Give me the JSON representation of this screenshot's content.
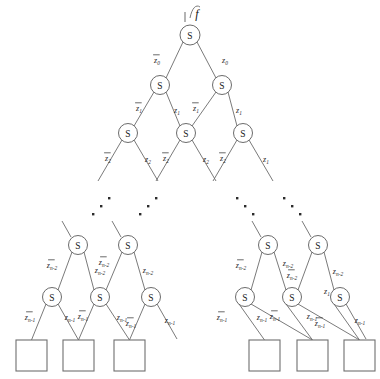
{
  "figure": {
    "type": "binary-decision-tree",
    "function_label": "f",
    "node_symbol": "S",
    "terminal_shape": "square"
  },
  "nodes": {
    "root": {
      "label": "S",
      "x": 190,
      "y": 35,
      "r": 10
    },
    "level2": [
      {
        "label": "S",
        "x": 160,
        "y": 85,
        "r": 9.5
      },
      {
        "label": "S",
        "x": 222,
        "y": 85,
        "r": 9.5
      }
    ],
    "level3": [
      {
        "label": "S",
        "x": 128,
        "y": 133,
        "r": 9.5
      },
      {
        "label": "S",
        "x": 186,
        "y": 133,
        "r": 9.5
      },
      {
        "label": "S",
        "x": 243,
        "y": 133,
        "r": 9.5
      }
    ],
    "left_cluster_upper": [
      {
        "label": "S",
        "x": 78,
        "y": 245,
        "r": 9.5
      },
      {
        "label": "S",
        "x": 128,
        "y": 245,
        "r": 9.5
      }
    ],
    "left_cluster_lower": [
      {
        "label": "S",
        "x": 52,
        "y": 297,
        "r": 9.5
      },
      {
        "label": "S",
        "x": 100,
        "y": 297,
        "r": 9.5
      },
      {
        "label": "S",
        "x": 151,
        "y": 297,
        "r": 9.5
      }
    ],
    "right_cluster_upper": [
      {
        "label": "S",
        "x": 268,
        "y": 245,
        "r": 9.5
      },
      {
        "label": "S",
        "x": 318,
        "y": 245,
        "r": 9.5
      }
    ],
    "right_cluster_lower": [
      {
        "label": "S",
        "x": 245,
        "y": 297,
        "r": 9.5
      },
      {
        "label": "S",
        "x": 292,
        "y": 297,
        "r": 9.5
      },
      {
        "label": "S",
        "x": 340,
        "y": 297,
        "r": 9.5
      }
    ]
  },
  "terminals": [
    {
      "x": 16,
      "y": 340,
      "w": 31,
      "h": 31
    },
    {
      "x": 63,
      "y": 340,
      "w": 31,
      "h": 31
    },
    {
      "x": 114,
      "y": 340,
      "w": 31,
      "h": 31
    },
    {
      "x": 249,
      "y": 340,
      "w": 31,
      "h": 31
    },
    {
      "x": 297,
      "y": 340,
      "w": 31,
      "h": 31
    },
    {
      "x": 344,
      "y": 340,
      "w": 31,
      "h": 31
    }
  ],
  "edge_labels": {
    "level1": [
      {
        "base": "z",
        "sub": "0",
        "negated": true,
        "x": 157,
        "y": 60
      },
      {
        "base": "z",
        "sub": "0",
        "negated": false,
        "x": 225,
        "y": 60
      }
    ],
    "level2": [
      {
        "base": "z",
        "sub": "1",
        "negated": true,
        "x": 139,
        "y": 108
      },
      {
        "base": "z",
        "sub": "1",
        "negated": false,
        "x": 177,
        "y": 110
      },
      {
        "base": "z",
        "sub": "1",
        "negated": true,
        "x": 196,
        "y": 108
      },
      {
        "base": "z",
        "sub": "1",
        "negated": false,
        "x": 239,
        "y": 110
      }
    ],
    "level3": [
      {
        "base": "z",
        "sub": "2",
        "negated": true,
        "x": 108,
        "y": 158
      },
      {
        "base": "z",
        "sub": "2",
        "negated": false,
        "x": 148,
        "y": 159
      },
      {
        "base": "z",
        "sub": "2",
        "negated": true,
        "x": 166,
        "y": 158
      },
      {
        "base": "z",
        "sub": "2",
        "negated": false,
        "x": 206,
        "y": 159
      },
      {
        "base": "z",
        "sub": "2",
        "negated": true,
        "x": 223,
        "y": 158
      },
      {
        "base": "z",
        "sub": "1",
        "negated": false,
        "x": 266,
        "y": 159
      }
    ],
    "left_cluster_upper": [
      {
        "base": "z",
        "sub": "n-2",
        "negated": true,
        "x": 52,
        "y": 265
      },
      {
        "base": "z",
        "sub": "n-2",
        "negated": false,
        "x": 100,
        "y": 270
      },
      {
        "base": "z",
        "sub": "n-2",
        "negated": true,
        "x": 104,
        "y": 262
      },
      {
        "base": "z",
        "sub": "n-2",
        "negated": false,
        "x": 148,
        "y": 270
      }
    ],
    "left_cluster_lower": [
      {
        "base": "z",
        "sub": "n-1",
        "negated": true,
        "x": 30,
        "y": 317
      },
      {
        "base": "z",
        "sub": "n-1",
        "negated": false,
        "x": 70,
        "y": 317
      },
      {
        "base": "z",
        "sub": "n-1",
        "negated": true,
        "x": 83,
        "y": 316
      },
      {
        "base": "z",
        "sub": "n-1",
        "negated": false,
        "x": 122,
        "y": 317
      },
      {
        "base": "z",
        "sub": "n-1",
        "negated": true,
        "x": 131,
        "y": 323
      },
      {
        "base": "z",
        "sub": "n-1",
        "negated": false,
        "x": 170,
        "y": 320
      }
    ],
    "right_cluster_upper": [
      {
        "base": "z",
        "sub": "n-2",
        "negated": true,
        "x": 241,
        "y": 265
      },
      {
        "base": "z",
        "sub": "n-2",
        "negated": false,
        "x": 288,
        "y": 263
      },
      {
        "base": "z",
        "sub": "n-2",
        "negated": true,
        "x": 292,
        "y": 275
      },
      {
        "base": "z",
        "sub": "n-2",
        "negated": false,
        "x": 338,
        "y": 271
      }
    ],
    "right_cluster_lower": [
      {
        "base": "z",
        "sub": "n-1",
        "negated": true,
        "x": 222,
        "y": 317
      },
      {
        "base": "z",
        "sub": "n-1",
        "negated": false,
        "x": 262,
        "y": 317
      },
      {
        "base": "z",
        "sub": "n-1",
        "negated": true,
        "x": 275,
        "y": 316
      },
      {
        "base": "z",
        "sub": "n-1",
        "negated": false,
        "x": 312,
        "y": 316
      },
      {
        "base": "z",
        "sub": "n-1",
        "negated": true,
        "x": 320,
        "y": 323
      },
      {
        "base": "z",
        "sub": "n-1",
        "negated": false,
        "x": 360,
        "y": 320
      }
    ],
    "extra": [
      {
        "base": "z",
        "sub": "1",
        "negated": false,
        "x": 327,
        "y": 291
      }
    ]
  },
  "ellipsis_groups": [
    {
      "direction": "up-right",
      "dots": [
        [
          92,
          213
        ],
        [
          100,
          205
        ],
        [
          108,
          197
        ]
      ]
    },
    {
      "direction": "up-right",
      "dots": [
        [
          139,
          213
        ],
        [
          147,
          205
        ],
        [
          155,
          197
        ]
      ]
    },
    {
      "direction": "down-right",
      "dots": [
        [
          236,
          197
        ],
        [
          244,
          205
        ],
        [
          252,
          213
        ]
      ]
    },
    {
      "direction": "down-right",
      "dots": [
        [
          283,
          197
        ],
        [
          291,
          205
        ],
        [
          299,
          213
        ]
      ]
    }
  ],
  "colors": {
    "edge": "#6b6b6b",
    "node_stroke": "#5a5a5a",
    "leaf_stroke": "#6f6f6f",
    "text": "#1a1a1a",
    "background": "#ffffff"
  }
}
